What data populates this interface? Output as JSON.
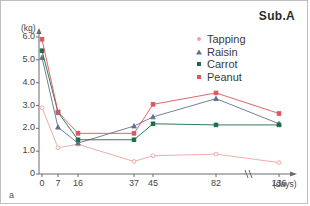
{
  "panel": {
    "label": "a"
  },
  "chart_data": {
    "type": "line",
    "title": "Sub.A",
    "xlabel": "(days)",
    "ylabel": "(kg)",
    "x": [
      0,
      7,
      16,
      37,
      45,
      82,
      136
    ],
    "x_tick_labels": [
      "0",
      "7",
      "16",
      "37",
      "45",
      "82",
      "136"
    ],
    "y_tick_labels": [
      "0",
      "1.0",
      "2.0",
      "3.0",
      "4.0",
      "5.0",
      "6.0"
    ],
    "y_ticks": [
      0,
      1.0,
      2.0,
      3.0,
      4.0,
      5.0,
      6.0
    ],
    "ylim": [
      0,
      6.4
    ],
    "grid": false,
    "axis_break": true,
    "legend_position": "top-right",
    "series": [
      {
        "name": "Tapping",
        "color": "#f2a0a0",
        "marker": "circle",
        "values": [
          2.9,
          1.15,
          1.3,
          0.55,
          0.8,
          0.87,
          0.5
        ]
      },
      {
        "name": "Raisin",
        "color": "#63708c",
        "marker": "triangle",
        "values": [
          5.1,
          2.05,
          1.35,
          2.1,
          2.5,
          3.3,
          2.2
        ]
      },
      {
        "name": "Carrot",
        "color": "#1d6b46",
        "marker": "square",
        "values": [
          5.4,
          2.7,
          1.5,
          1.5,
          2.2,
          2.15,
          2.15
        ]
      },
      {
        "name": "Peanut",
        "color": "#e0525c",
        "marker": "square",
        "values": [
          5.9,
          2.72,
          1.78,
          1.78,
          3.05,
          3.55,
          2.65
        ]
      }
    ]
  }
}
